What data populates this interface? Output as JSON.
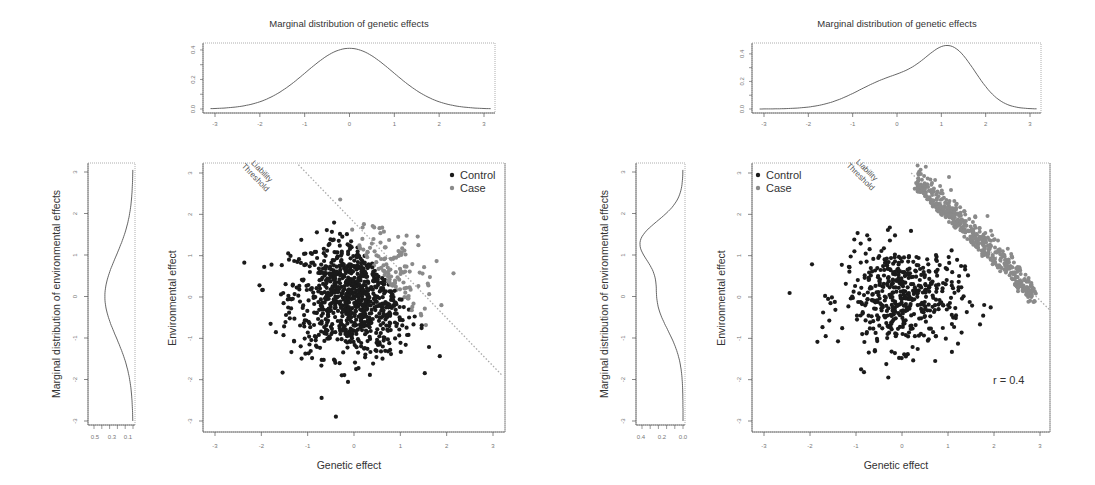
{
  "chart_data": [
    {
      "panel": "left",
      "type": "scatter",
      "top_density": {
        "title": "Marginal distribution of genetic effects",
        "type": "line",
        "xticks": [
          -3,
          -2,
          -1,
          0,
          1,
          2,
          3
        ],
        "yticks": [
          "0.0",
          "0.2",
          "0.4"
        ],
        "ylim": [
          0,
          0.42
        ],
        "shape": "normal",
        "mean": 0.0,
        "sd": 1.0
      },
      "side_density": {
        "ylabel": "Marginal distribution of environmental effects",
        "type": "line",
        "yticks": [
          -3,
          -2,
          -1,
          0,
          1,
          2,
          3
        ],
        "xticks": [
          "0.5",
          "0.3",
          "0.1"
        ],
        "xlim_reversed": [
          0.6,
          0.0
        ],
        "shape": "normal",
        "mean": 0.0,
        "sd": 1.0
      },
      "scatter": {
        "xlabel": "Genetic effect",
        "ylabel": "Environmental effect",
        "xlim": [
          -3.2,
          3.2
        ],
        "ylim": [
          -3.2,
          3.2
        ],
        "xticks": [
          -3,
          -2,
          -1,
          0,
          1,
          2,
          3
        ],
        "yticks": [
          -3,
          -2,
          -1,
          0,
          1,
          2,
          3
        ],
        "threshold_label": [
          "Liability",
          "Threshold"
        ],
        "threshold_line": {
          "x1": -1.2,
          "y1": 3.2,
          "x2": 3.2,
          "y2": -1.9
        },
        "legend": [
          {
            "label": "Control",
            "color": "#1a1a1a"
          },
          {
            "label": "Case",
            "color": "#8a8a8a"
          }
        ],
        "legend_position": "top-right",
        "n_points": 1000,
        "distribution": "bivariate normal, mean 0, sd 0.65, r = 0",
        "case_rule": "x + y > 1.6 (points above liability threshold)"
      }
    },
    {
      "panel": "right",
      "type": "scatter",
      "top_density": {
        "title": "Marginal distribution of genetic effects",
        "type": "line",
        "xticks": [
          -3,
          -2,
          -1,
          0,
          1,
          2,
          3
        ],
        "yticks": [
          "0.0",
          "0.2",
          "0.4"
        ],
        "ylim": [
          0,
          0.45
        ],
        "shape": "bimodal, peak near 1.2, shoulder near 0.2"
      },
      "side_density": {
        "ylabel": "Marginal distribution of environmental effects",
        "type": "line",
        "yticks": [
          -3,
          -2,
          -1,
          0,
          1,
          2,
          3
        ],
        "xticks": [
          "0.4",
          "0.2",
          "0.0"
        ],
        "xlim_reversed": [
          0.45,
          0.0
        ],
        "shape": "bimodal, peak near 1.3, shoulder near 0"
      },
      "scatter": {
        "xlabel": "Genetic effect",
        "ylabel": "Environmental effect",
        "xlim": [
          -3.2,
          3.2
        ],
        "ylim": [
          -3.2,
          3.2
        ],
        "xticks": [
          -3,
          -2,
          -1,
          0,
          1,
          2,
          3
        ],
        "yticks": [
          -3,
          -2,
          -1,
          0,
          1,
          2,
          3
        ],
        "threshold_label": [
          "Liability",
          "Threshold"
        ],
        "threshold_line": {
          "x1": 0.2,
          "y1": 3.0,
          "x2": 3.2,
          "y2": -0.3
        },
        "legend": [
          {
            "label": "Control",
            "color": "#1a1a1a"
          },
          {
            "label": "Case",
            "color": "#8a8a8a"
          }
        ],
        "legend_position": "top-left",
        "annotation": "r  = 0.4",
        "n_control": 500,
        "n_case": 500,
        "distribution": "control: bivariate normal around (0,0); case: band just above threshold x + y ≈ 2.5–3.5"
      }
    }
  ]
}
